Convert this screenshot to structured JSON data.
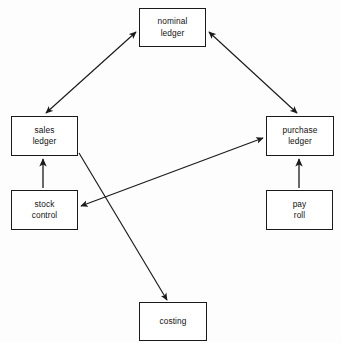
{
  "diagram": {
    "canvas": {
      "width": 341,
      "height": 343,
      "background": "#fdfdfd"
    },
    "style": {
      "box_fill": "#ffffff",
      "box_stroke": "#1a1a1a",
      "arrow_stroke": "#1a1a1a",
      "text_color": "#111111"
    },
    "nodes": [
      {
        "id": "nominal-ledger",
        "label": "nominal ledger",
        "lines": [
          "nominal",
          "ledger"
        ],
        "x": 139,
        "y": 8,
        "width": 67,
        "height": 39
      },
      {
        "id": "sales-ledger",
        "label": "sales ledger",
        "lines": [
          "sales",
          "ledger"
        ],
        "x": 11,
        "y": 116,
        "width": 67,
        "height": 40
      },
      {
        "id": "purchase-ledger",
        "label": "purchase ledger",
        "lines": [
          "purchase",
          "ledger"
        ],
        "x": 266,
        "y": 116,
        "width": 68,
        "height": 40
      },
      {
        "id": "stock-control",
        "label": "stock control",
        "lines": [
          "stock",
          "control"
        ],
        "x": 11,
        "y": 190,
        "width": 67,
        "height": 40
      },
      {
        "id": "pay-roll",
        "label": "pay roll",
        "lines": [
          "pay",
          "roll"
        ],
        "x": 266,
        "y": 190,
        "width": 67,
        "height": 40
      },
      {
        "id": "costing",
        "label": "costing",
        "lines": [
          "costing"
        ],
        "x": 139,
        "y": 302,
        "width": 68,
        "height": 39
      }
    ],
    "edges": [
      {
        "id": "sales-ledger-nominal-ledger",
        "from": "sales-ledger",
        "to": "nominal-ledger",
        "direction": "bidirectional",
        "x1": 46,
        "y1": 113,
        "x2": 136,
        "y2": 32
      },
      {
        "id": "nominal-ledger-purchase-ledger",
        "from": "nominal-ledger",
        "to": "purchase-ledger",
        "direction": "bidirectional",
        "x1": 209,
        "y1": 32,
        "x2": 297,
        "y2": 113
      },
      {
        "id": "stock-control-sales-ledger",
        "from": "stock-control",
        "to": "sales-ledger",
        "direction": "up",
        "x1": 43,
        "y1": 188,
        "x2": 43,
        "y2": 159
      },
      {
        "id": "pay-roll-purchase-ledger",
        "from": "pay-roll",
        "to": "purchase-ledger",
        "direction": "up",
        "x1": 299,
        "y1": 188,
        "x2": 299,
        "y2": 159
      },
      {
        "id": "stock-control-purchase-ledger",
        "from": "stock-control",
        "to": "purchase-ledger",
        "direction": "bidirectional",
        "x1": 81,
        "y1": 206,
        "x2": 263,
        "y2": 138
      },
      {
        "id": "sales-ledger-costing",
        "from": "sales-ledger",
        "to": "costing",
        "direction": "down",
        "x1": 79,
        "y1": 153,
        "x2": 167,
        "y2": 300
      }
    ]
  }
}
